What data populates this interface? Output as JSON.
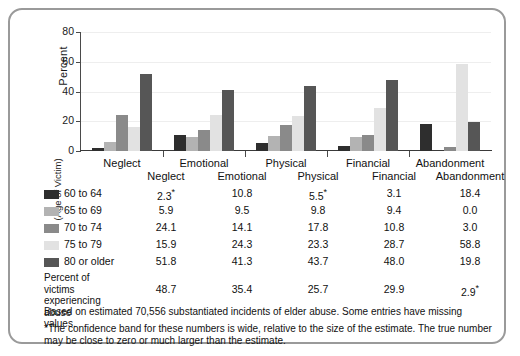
{
  "chart_data": {
    "type": "bar",
    "title": "",
    "xlabel": "",
    "ylabel": "Percent",
    "ylim": [
      0,
      80
    ],
    "yticks": [
      0,
      20,
      40,
      60,
      80
    ],
    "grid": true,
    "legend_position": "below-table",
    "legend_title": "(Age of Victim)",
    "categories": [
      "Neglect",
      "Emotional",
      "Physical",
      "Financial",
      "Abandonment"
    ],
    "series": [
      {
        "name": "60 to 64",
        "color": "#2e2e2e",
        "values": [
          2.3,
          10.8,
          5.5,
          3.1,
          18.4
        ],
        "labels": [
          "2.3*",
          "10.8",
          "5.5*",
          "3.1",
          "18.4"
        ]
      },
      {
        "name": "65 to 69",
        "color": "#b3b3b3",
        "values": [
          5.9,
          9.5,
          9.8,
          9.4,
          0.0
        ],
        "labels": [
          "5.9",
          "9.5",
          "9.8",
          "9.4",
          "0.0"
        ]
      },
      {
        "name": "70 to 74",
        "color": "#8a8a8a",
        "values": [
          24.1,
          14.1,
          17.8,
          10.8,
          3.0
        ],
        "labels": [
          "24.1",
          "14.1",
          "17.8",
          "10.8",
          "3.0"
        ]
      },
      {
        "name": "75 to 79",
        "color": "#e2e2e2",
        "values": [
          15.9,
          24.3,
          23.3,
          28.7,
          58.8
        ],
        "labels": [
          "15.9",
          "24.3",
          "23.3",
          "28.7",
          "58.8"
        ]
      },
      {
        "name": "80 or older",
        "color": "#565656",
        "values": [
          51.8,
          41.3,
          43.7,
          48.0,
          19.8
        ],
        "labels": [
          "51.8",
          "41.3",
          "43.7",
          "48.0",
          "19.8"
        ]
      }
    ],
    "summary_row": {
      "label": "Percent of victims experiencing abuse",
      "values": [
        48.7,
        35.4,
        25.7,
        29.9,
        2.9
      ],
      "labels": [
        "48.7",
        "35.4",
        "25.7",
        "29.9",
        "2.9*"
      ]
    },
    "annotations": [
      "Based on estimated 70,556 substantiated incidents of elder abuse. Some entries have missing values.",
      "*The confidence band for these numbers is wide, relative to the size of the estimate. The true number may be close to zero or much larger than the estimate."
    ]
  },
  "colors": {
    "frame_border": "#9a9a9a",
    "axis": "#3a3a3a",
    "gridline": "#eeeeee",
    "background": "#ffffff"
  }
}
